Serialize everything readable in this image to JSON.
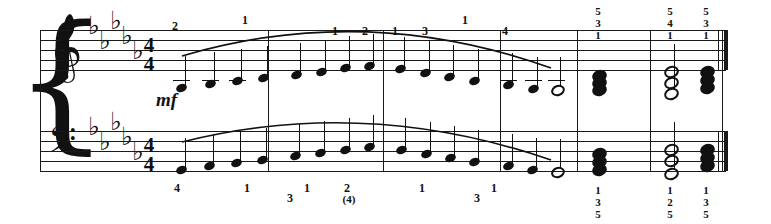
{
  "score": {
    "title": "Piano score excerpt",
    "time_signature": {
      "numerator": "4",
      "denominator": "4"
    },
    "key_signature": {
      "flats": 5,
      "name": "D-flat major"
    },
    "dynamic": "mf",
    "clefs": {
      "treble": "𝄞",
      "bass": "𝄢"
    },
    "symbols": {
      "flat": "♭",
      "brace": "{"
    },
    "barlines": [
      268,
      383,
      500,
      577,
      650,
      722
    ],
    "final_barline": "double"
  },
  "treble": {
    "fingerings": [
      "2",
      "1",
      "1",
      "2",
      "1",
      "3",
      "1",
      "4"
    ],
    "fingering_x": [
      168,
      238,
      328,
      358,
      388,
      418,
      458,
      498
    ],
    "notes": [
      {
        "x": 176,
        "y": 84,
        "type": "quarter",
        "ledger": 1
      },
      {
        "x": 205,
        "y": 80,
        "type": "quarter",
        "ledger": 1
      },
      {
        "x": 232,
        "y": 77,
        "type": "quarter",
        "ledger": 1
      },
      {
        "x": 258,
        "y": 74,
        "type": "quarter",
        "ledger": 0
      },
      {
        "x": 291,
        "y": 71,
        "type": "quarter",
        "ledger": 0
      },
      {
        "x": 316,
        "y": 68,
        "type": "quarter",
        "ledger": 0
      },
      {
        "x": 340,
        "y": 64,
        "type": "quarter",
        "ledger": 0
      },
      {
        "x": 364,
        "y": 62,
        "type": "quarter",
        "ledger": 0
      },
      {
        "x": 395,
        "y": 65,
        "type": "quarter",
        "ledger": 0
      },
      {
        "x": 420,
        "y": 69,
        "type": "quarter",
        "ledger": 0
      },
      {
        "x": 444,
        "y": 73,
        "type": "quarter",
        "ledger": 0
      },
      {
        "x": 469,
        "y": 77,
        "type": "quarter",
        "ledger": 0
      },
      {
        "x": 503,
        "y": 81,
        "type": "quarter",
        "ledger": 1
      },
      {
        "x": 528,
        "y": 85,
        "type": "quarter",
        "ledger": 1
      },
      {
        "x": 551,
        "y": 85,
        "type": "half",
        "ledger": 1
      }
    ],
    "chords": [
      {
        "x": 592,
        "type": "filled",
        "fingering": [
          "5",
          "3",
          "1"
        ],
        "heads": [
          70,
          77,
          84
        ]
      },
      {
        "x": 664,
        "type": "open",
        "fingering": [
          "5",
          "4",
          "1"
        ],
        "heads": [
          66,
          77,
          88
        ]
      },
      {
        "x": 700,
        "type": "filled",
        "fingering": [
          "5",
          "3",
          "1"
        ],
        "heads": [
          66,
          74,
          82
        ]
      }
    ]
  },
  "bass": {
    "fingerings": [
      "4",
      "1",
      "3",
      "1",
      "2",
      "1",
      "3",
      "1"
    ],
    "fingering_x": [
      170,
      240,
      283,
      300,
      340,
      415,
      470,
      487
    ],
    "fingering_paren": "(4)",
    "notes": [
      {
        "x": 176,
        "y": 166,
        "type": "quarter",
        "ledger": 0
      },
      {
        "x": 204,
        "y": 162,
        "type": "quarter",
        "ledger": 0
      },
      {
        "x": 231,
        "y": 159,
        "type": "quarter",
        "ledger": 0
      },
      {
        "x": 257,
        "y": 156,
        "type": "quarter",
        "ledger": 0
      },
      {
        "x": 290,
        "y": 152,
        "type": "quarter",
        "ledger": 0
      },
      {
        "x": 315,
        "y": 149,
        "type": "quarter",
        "ledger": 0
      },
      {
        "x": 340,
        "y": 146,
        "type": "quarter",
        "ledger": 0
      },
      {
        "x": 364,
        "y": 143,
        "type": "quarter",
        "ledger": 0
      },
      {
        "x": 396,
        "y": 146,
        "type": "quarter",
        "ledger": 0
      },
      {
        "x": 421,
        "y": 150,
        "type": "quarter",
        "ledger": 0
      },
      {
        "x": 445,
        "y": 154,
        "type": "quarter",
        "ledger": 0
      },
      {
        "x": 469,
        "y": 158,
        "type": "quarter",
        "ledger": 0
      },
      {
        "x": 503,
        "y": 162,
        "type": "quarter",
        "ledger": 0
      },
      {
        "x": 527,
        "y": 166,
        "type": "quarter",
        "ledger": 0
      },
      {
        "x": 551,
        "y": 167,
        "type": "half",
        "ledger": 0
      }
    ],
    "chords": [
      {
        "x": 592,
        "type": "filled",
        "fingering": [
          "1",
          "3",
          "5"
        ],
        "heads": [
          148,
          156,
          164
        ]
      },
      {
        "x": 664,
        "type": "open",
        "fingering": [
          "1",
          "2",
          "5"
        ],
        "heads": [
          144,
          155,
          168
        ]
      },
      {
        "x": 700,
        "type": "filled",
        "fingering": [
          "1",
          "3",
          "5"
        ],
        "heads": [
          144,
          152,
          160
        ]
      }
    ]
  }
}
